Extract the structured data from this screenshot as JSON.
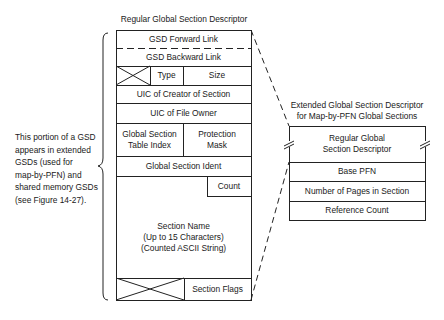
{
  "regular_gsd": {
    "title": "Regular Global Section Descriptor",
    "fields": {
      "forward_link": "GSD Forward Link",
      "backward_link": "GSD Backward Link",
      "type": "Type",
      "size": "Size",
      "uic_creator": "UIC of Creator of Section",
      "uic_owner": "UIC of File Owner",
      "table_index_line1": "Global Section",
      "table_index_line2": "Table Index",
      "protection_line1": "Protection",
      "protection_line2": "Mask",
      "ident": "Global Section Ident",
      "count": "Count",
      "name_line1": "Section Name",
      "name_line2": "(Up to 15 Characters)",
      "name_line3": "(Counted ASCII String)",
      "flags": "Section Flags"
    }
  },
  "side_note": {
    "lines": [
      "This portion of a GSD",
      "appears in extended",
      "GSDs (used for",
      "map-by-PFN) and",
      "shared memory GSDs",
      "(see Figure 14-27)."
    ]
  },
  "extended_gsd": {
    "title_line1": "Extended Global Section Descriptor",
    "title_line2": "for Map-by-PFN Global Sections",
    "fields": {
      "regular_line1": "Regular Global",
      "regular_line2": "Section Descriptor",
      "base_pfn": "Base PFN",
      "num_pages": "Number of Pages in Section",
      "ref_count": "Reference Count"
    }
  }
}
